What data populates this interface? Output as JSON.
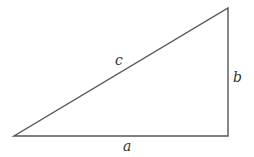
{
  "diagram": {
    "type": "right-triangle",
    "vertices": {
      "bottom_left": [
        14,
        136
      ],
      "bottom_right": [
        228,
        136
      ],
      "top_right": [
        228,
        8
      ]
    },
    "stroke_color": "#555555",
    "labels": {
      "hypotenuse": "c",
      "vertical_leg": "b",
      "horizontal_leg": "a"
    }
  }
}
